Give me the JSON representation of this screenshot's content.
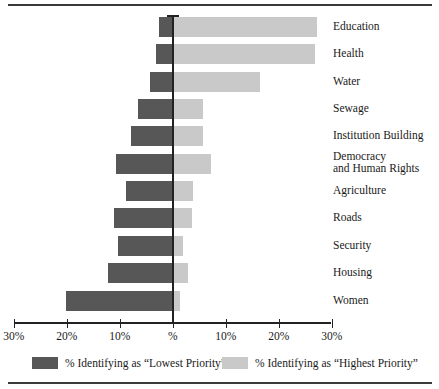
{
  "chart_data": {
    "type": "bar",
    "orientation": "horizontal",
    "subtype": "diverging-bar",
    "title": "",
    "xlabel": "",
    "ylabel": "",
    "categories": [
      "Education",
      "Health",
      "Water",
      "Sewage",
      "Institution Building",
      "Democracy\nand Human Rights",
      "Agriculture",
      "Roads",
      "Security",
      "Housing",
      "Women"
    ],
    "series": [
      {
        "name": "% Identifying as \"Lowest Priority\"",
        "color": "#575757",
        "direction": "left",
        "values": [
          2.6,
          3.2,
          4.2,
          6.5,
          7.9,
          10.7,
          8.8,
          11.1,
          10.3,
          12.3,
          20.2
        ]
      },
      {
        "name": "% Identifying as \"Highest Priority\"",
        "color": "#c9c9c9",
        "direction": "right",
        "values": [
          27.2,
          26.8,
          16.5,
          5.8,
          5.7,
          7.2,
          3.8,
          3.7,
          1.9,
          2.9,
          1.4
        ]
      }
    ],
    "xlim": [
      -30,
      30
    ],
    "xticks": [
      -30,
      -20,
      -10,
      0,
      10,
      20,
      30
    ],
    "xtick_labels": [
      "30%",
      "20%",
      "10%",
      "%",
      "10%",
      "20%",
      "30%"
    ],
    "grid": false,
    "legend_position": "bottom"
  },
  "axis": {
    "ticks": [
      {
        "label": "30%",
        "value": -30
      },
      {
        "label": "20%",
        "value": -20
      },
      {
        "label": "10%",
        "value": -10
      },
      {
        "label": "%",
        "value": 0
      },
      {
        "label": "10%",
        "value": 10
      },
      {
        "label": "20%",
        "value": 20
      },
      {
        "label": "30%",
        "value": 30
      }
    ]
  },
  "legend": {
    "items": [
      {
        "label": "% Identifying as “Lowest Priority”",
        "color": "#575757"
      },
      {
        "label": "% Identifying as “Highest Priority”",
        "color": "#c9c9c9"
      }
    ]
  },
  "colors": {
    "lowest_priority": "#575757",
    "highest_priority": "#c9c9c9",
    "axis": "#222222",
    "rule": "#3a3a3a",
    "background": "#ffffff"
  }
}
